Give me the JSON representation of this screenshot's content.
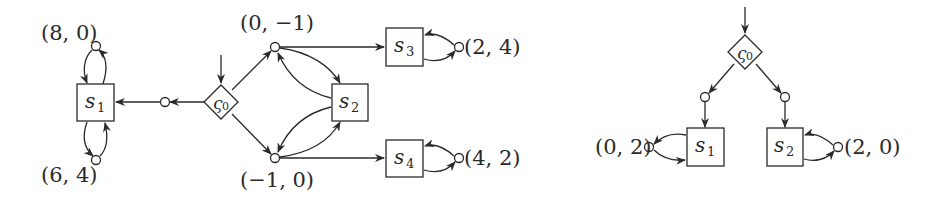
{
  "left_game": {
    "initial": {
      "symbol": "ς",
      "sub": "0"
    },
    "states": [
      {
        "id": "s1",
        "name": "s",
        "sub": "1"
      },
      {
        "id": "s2",
        "name": "s",
        "sub": "2"
      },
      {
        "id": "s3",
        "name": "s",
        "sub": "3"
      },
      {
        "id": "s4",
        "name": "s",
        "sub": "4"
      }
    ],
    "payoffs": {
      "s1_top": "(8, 0)",
      "s1_bottom": "(6, 4)",
      "upper_branch": "(0, −1)",
      "lower_branch": "(−1, 0)",
      "s3_loop": "(2, 4)",
      "s4_loop": "(4, 2)"
    }
  },
  "right_game": {
    "initial": {
      "symbol": "ς",
      "sub": "0"
    },
    "states": [
      {
        "id": "s1",
        "name": "s",
        "sub": "1"
      },
      {
        "id": "s2",
        "name": "s",
        "sub": "2"
      }
    ],
    "payoffs": {
      "s1_loop": "(0, 2)",
      "s2_loop": "(2, 0)"
    }
  },
  "colors": {
    "stroke": "#2a2a2a",
    "background": "#ffffff"
  }
}
